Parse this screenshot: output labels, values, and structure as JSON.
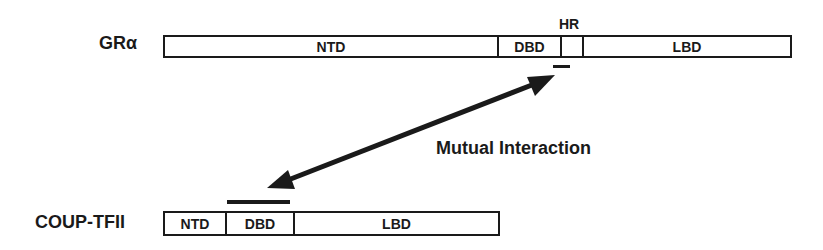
{
  "proteins": {
    "gr": {
      "name": "GRα",
      "domains": [
        {
          "label": "NTD",
          "width": 334
        },
        {
          "label": "DBD",
          "width": 63
        },
        {
          "label": "",
          "width": 22
        },
        {
          "label": "LBD",
          "width": 210
        }
      ],
      "hr_label": "HR"
    },
    "coup": {
      "name": "COUP-TFII",
      "domains": [
        {
          "label": "NTD",
          "width": 62
        },
        {
          "label": "DBD",
          "width": 68
        },
        {
          "label": "LBD",
          "width": 207
        }
      ]
    }
  },
  "interaction": {
    "label": "Mutual Interaction"
  },
  "colors": {
    "ink": "#1a1a1a",
    "background": "#ffffff"
  }
}
